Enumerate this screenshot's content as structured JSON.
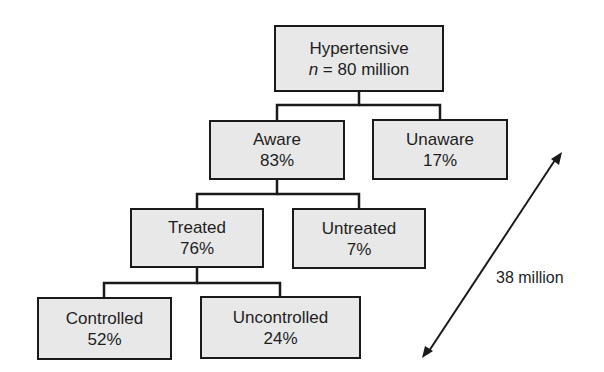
{
  "diagram": {
    "root": {
      "title": "Hypertensive",
      "n_label": "n",
      "n_rest": " = 80 million"
    },
    "nodes": {
      "aware": {
        "label": "Aware",
        "value": "83%"
      },
      "unaware": {
        "label": "Unaware",
        "value": "17%"
      },
      "treated": {
        "label": "Treated",
        "value": "76%"
      },
      "untreated": {
        "label": "Untreated",
        "value": "7%"
      },
      "controlled": {
        "label": "Controlled",
        "value": "52%"
      },
      "uncontrolled": {
        "label": "Uncontrolled",
        "value": "24%"
      }
    },
    "annotation": {
      "label": "38 million"
    },
    "colors": {
      "box_fill": "#e8e8e8",
      "box_border": "#1a1a1a",
      "text": "#1e1e1e"
    }
  }
}
